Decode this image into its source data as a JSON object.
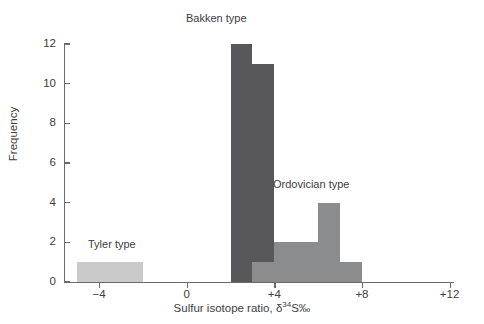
{
  "chart_data": {
    "type": "bar",
    "title": "",
    "xlabel": "Sulfur isotope ratio, δ34S‰",
    "xlabel_parts": {
      "prefix": "Sulfur isotope ratio, δ",
      "superscript": "34",
      "suffix": "S‰"
    },
    "ylabel": "Frequency",
    "xlim": [
      -5.6,
      12.2
    ],
    "ylim": [
      0,
      12
    ],
    "grid": false,
    "legend": "none",
    "xticks": [
      -4,
      0,
      4,
      8,
      12
    ],
    "xtick_labels": [
      "−4",
      "0",
      "+4",
      "+8",
      "+12"
    ],
    "yticks": [
      0,
      2,
      4,
      6,
      8,
      10,
      12
    ],
    "ytick_labels": [
      "0",
      "2",
      "4",
      "6",
      "8",
      "10",
      "12"
    ],
    "bin_width": 1,
    "bars": [
      {
        "x0": -5,
        "x1": -4,
        "value": 1,
        "group": "Tyler type",
        "color": "#c9caca"
      },
      {
        "x0": -4,
        "x1": -3,
        "value": 1,
        "group": "Tyler type",
        "color": "#c9caca"
      },
      {
        "x0": -3,
        "x1": -2,
        "value": 1,
        "group": "Tyler type",
        "color": "#c9caca"
      },
      {
        "x0": 2,
        "x1": 3,
        "value": 12,
        "group": "Bakken type",
        "color": "#58585a"
      },
      {
        "x0": 3,
        "x1": 4,
        "value": 11,
        "group": "Bakken type",
        "color": "#58585a"
      },
      {
        "x0": 3,
        "x1": 4,
        "value": 1,
        "group": "Ordovician type",
        "color": "#8b8c8d"
      },
      {
        "x0": 4,
        "x1": 5,
        "value": 2,
        "group": "Ordovician type",
        "color": "#8b8c8d"
      },
      {
        "x0": 5,
        "x1": 6,
        "value": 2,
        "group": "Ordovician type",
        "color": "#8b8c8d"
      },
      {
        "x0": 6,
        "x1": 7,
        "value": 4,
        "group": "Ordovician type",
        "color": "#8b8c8d"
      },
      {
        "x0": 7,
        "x1": 8,
        "value": 1,
        "group": "Ordovician type",
        "color": "#8b8c8d"
      }
    ],
    "annotations": [
      {
        "name": "bakken",
        "text": "Bakken type"
      },
      {
        "name": "ordovician",
        "text": "Ordovician type"
      },
      {
        "name": "tyler",
        "text": "Tyler type"
      }
    ],
    "colors": {
      "tyler": "#c9caca",
      "bakken": "#58585a",
      "ordovician": "#8b8c8d",
      "axis": "#6e6a6b",
      "text": "#3d3d3d",
      "background": "#ffffff"
    }
  }
}
